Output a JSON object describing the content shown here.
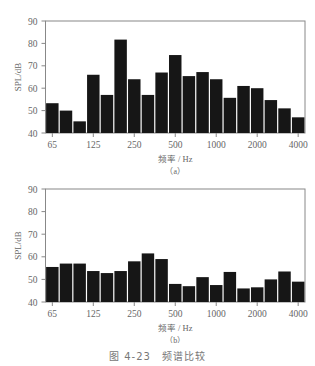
{
  "figure_caption": "图 4-23　频谱比较",
  "chart_data": [
    {
      "type": "bar",
      "panel_label": "（a）",
      "title": "",
      "xlabel": "频率 / Hz",
      "ylabel": "SPL/dB",
      "ylim": [
        40,
        90
      ],
      "yticks": [
        40,
        50,
        60,
        70,
        80,
        90
      ],
      "xtick_labels": [
        "65",
        "125",
        "250",
        "500",
        "1000",
        "2000",
        "4000"
      ],
      "categories": [
        "63",
        "80",
        "100",
        "125",
        "160",
        "200",
        "250",
        "315",
        "400",
        "500",
        "630",
        "800",
        "1000",
        "1250",
        "1600",
        "2000",
        "2500",
        "3150",
        "4000"
      ],
      "values": [
        53.3,
        50,
        45.2,
        66,
        57,
        81.7,
        64,
        57,
        67,
        74.8,
        65.4,
        67.2,
        64,
        55.7,
        61,
        60,
        54.7,
        51,
        47
      ],
      "grid": false,
      "bar_color": "#161616"
    },
    {
      "type": "bar",
      "panel_label": "（b）",
      "title": "",
      "xlabel": "频率 / Hz",
      "ylabel": "SPL/dB",
      "ylim": [
        40,
        90
      ],
      "yticks": [
        40,
        50,
        60,
        70,
        80,
        90
      ],
      "xtick_labels": [
        "65",
        "125",
        "250",
        "500",
        "1000",
        "2000",
        "4000"
      ],
      "categories": [
        "63",
        "80",
        "100",
        "125",
        "160",
        "200",
        "250",
        "315",
        "400",
        "500",
        "630",
        "800",
        "1000",
        "1250",
        "1600",
        "2000",
        "2500",
        "3150",
        "4000"
      ],
      "values": [
        55.5,
        57,
        57,
        53.7,
        52.8,
        53.7,
        58,
        61.5,
        59,
        48,
        47,
        51,
        47.5,
        53.3,
        46,
        46.5,
        50,
        53.5,
        49
      ],
      "grid": false,
      "bar_color": "#161616"
    }
  ]
}
